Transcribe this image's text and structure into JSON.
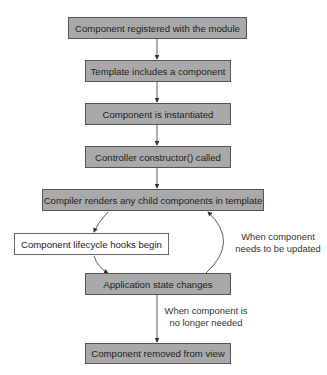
{
  "diagram": {
    "nodes": [
      {
        "id": "n1",
        "label": "Component registered with the module",
        "style": "gray"
      },
      {
        "id": "n2",
        "label": "Template includes a component",
        "style": "gray"
      },
      {
        "id": "n3",
        "label": "Component is instantiated",
        "style": "gray"
      },
      {
        "id": "n4",
        "label": "Controller constructor() called",
        "style": "gray"
      },
      {
        "id": "n5",
        "label": "Compiler renders any child components in template",
        "style": "gray"
      },
      {
        "id": "n6",
        "label": "Component lifecycle hooks begin",
        "style": "white"
      },
      {
        "id": "n7",
        "label": "Application state changes",
        "style": "gray"
      },
      {
        "id": "n8",
        "label": "Component removed from view",
        "style": "gray"
      }
    ],
    "edges": [
      {
        "from": "n1",
        "to": "n2",
        "label": ""
      },
      {
        "from": "n2",
        "to": "n3",
        "label": ""
      },
      {
        "from": "n3",
        "to": "n4",
        "label": ""
      },
      {
        "from": "n4",
        "to": "n5",
        "label": ""
      },
      {
        "from": "n5",
        "to": "n6",
        "label": ""
      },
      {
        "from": "n6",
        "to": "n7",
        "label": ""
      },
      {
        "from": "n7",
        "to": "n5",
        "label": "When component needs to be updated"
      },
      {
        "from": "n7",
        "to": "n8",
        "label": "When component is no longer needed"
      }
    ],
    "edge_labels": {
      "update_line1": "When component",
      "update_line2": "needs to be updated",
      "remove_line1": "When component is",
      "remove_line2": "no longer needed"
    },
    "colors": {
      "box_fill": "#a9a9a9",
      "box_border": "#555555",
      "highlight_fill": "#ffffff",
      "arrow": "#333333"
    }
  }
}
